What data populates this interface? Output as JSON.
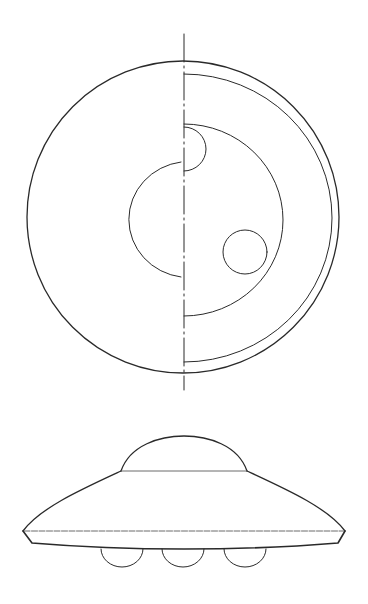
{
  "figure": {
    "kind": "technical-drawing",
    "background": "#ffffff",
    "line_color": "#2a2a2a",
    "views": [
      {
        "name": "top-view",
        "description": "Plan view of disc-shaped craft",
        "elements": [
          {
            "name": "outer-disc",
            "shape": "circle",
            "cx": 183,
            "cy": 217,
            "r": 156
          },
          {
            "name": "rim-ring-right-half",
            "shape": "half-arc",
            "cx": 184,
            "cy": 218,
            "r": 148
          },
          {
            "name": "inner-chamber-right-half",
            "shape": "half-ellipse",
            "cx": 184,
            "cy": 220,
            "rx": 99,
            "ry": 97
          },
          {
            "name": "upper-port-semicircle",
            "shape": "half-circle",
            "cx": 184,
            "cy": 149,
            "r": 22
          },
          {
            "name": "central-chamber-left-half",
            "shape": "half-circle",
            "cx": 183,
            "cy": 219,
            "r": 60
          },
          {
            "name": "side-port-circle",
            "shape": "circle",
            "cx": 245,
            "cy": 252,
            "r": 22
          },
          {
            "name": "axis-centerline",
            "shape": "line",
            "x": 184,
            "y1": 34,
            "y2": 390
          }
        ]
      },
      {
        "name": "side-view",
        "description": "Elevation view of disc-shaped craft",
        "elements": [
          {
            "name": "dome",
            "shape": "arc",
            "x1": 121,
            "x2": 247,
            "base_y": 471,
            "top_y": 436
          },
          {
            "name": "upper-hull",
            "shape": "curved-cone",
            "left_tip": [
              23,
              531
            ],
            "right_tip": [
              345,
              531
            ]
          },
          {
            "name": "rim-line",
            "shape": "line",
            "y": 531
          },
          {
            "name": "lower-hull",
            "shape": "curve",
            "y": 544
          },
          {
            "name": "landing-pods",
            "shape": "half-circles",
            "centers_x": [
              122,
              183,
              245
            ],
            "cy": 549,
            "r": 21
          }
        ]
      }
    ]
  }
}
